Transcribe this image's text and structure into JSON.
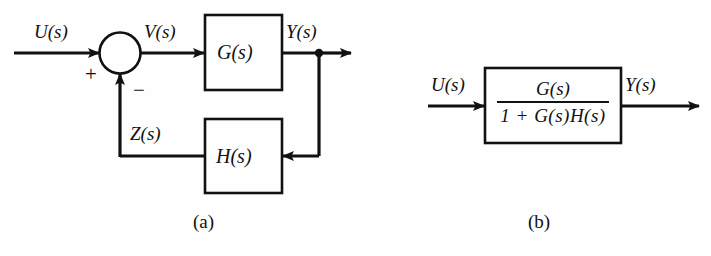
{
  "figure": {
    "title_a": "(a)",
    "title_b": "(b)"
  },
  "panel_a": {
    "caption": "(a)",
    "input_label": "U(s)",
    "error_label": "V(s)",
    "output_label": "Y(s)",
    "feedback_label": "Z(s)",
    "plus_sign": "+",
    "minus_sign": "−",
    "forward_block_label": "G(s)",
    "feedback_block_label": "H(s)"
  },
  "panel_b": {
    "caption": "(b)",
    "input_label": "U(s)",
    "output_label": "Y(s)",
    "numerator": "G(s)",
    "denominator": "1 + G(s)H(s)"
  },
  "colors": {
    "line": "#111111",
    "background": "#fefefe",
    "text": "#111111"
  }
}
